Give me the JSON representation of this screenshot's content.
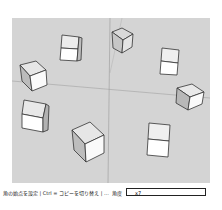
{
  "viewport": {
    "background": "#d4d4d4",
    "object_count": 9,
    "objects": "cubes arranged in a ring around the origin"
  },
  "status_bar": {
    "hint": "角の始点を設定 | Ctrl = コピーを切り替え | ...",
    "measurement_label": "角度",
    "measurement_value": "x7"
  }
}
